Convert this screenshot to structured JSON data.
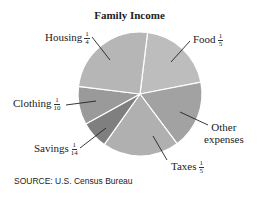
{
  "chart_data": {
    "type": "pie",
    "title": "Family Income",
    "start_angle_deg": 7,
    "direction": "clockwise",
    "slices": [
      {
        "label": "Food",
        "fraction_text": {
          "num": "1",
          "den": "5"
        },
        "value": 0.2,
        "color": "#bdbdbd"
      },
      {
        "label": "Other expenses",
        "fraction_text": null,
        "value": 0.1786,
        "color": "#a2a2a2"
      },
      {
        "label": "Taxes",
        "fraction_text": {
          "num": "1",
          "den": "5"
        },
        "value": 0.2,
        "color": "#b0b0b0"
      },
      {
        "label": "Savings",
        "fraction_text": {
          "num": "1",
          "den": "14"
        },
        "value": 0.0714,
        "color": "#7f7f7f"
      },
      {
        "label": "Clothing",
        "fraction_text": {
          "num": "1",
          "den": "10"
        },
        "value": 0.1,
        "color": "#9a9a9a"
      },
      {
        "label": "Housing",
        "fraction_text": {
          "num": "1",
          "den": "4"
        },
        "value": 0.25,
        "color": "#b6b6b6"
      }
    ],
    "source": "SOURCE: U.S. Census Bureau",
    "legend": "none (labels with leader lines)"
  },
  "labels": {
    "housing": {
      "name": "Housing",
      "num": "1",
      "den": "4"
    },
    "food": {
      "name": "Food",
      "num": "1",
      "den": "5"
    },
    "clothing": {
      "name": "Clothing",
      "num": "1",
      "den": "10"
    },
    "savings": {
      "name": "Savings",
      "num": "1",
      "den": "14"
    },
    "taxes": {
      "name": "Taxes",
      "num": "1",
      "den": "5"
    },
    "other": {
      "line1": "Other",
      "line2": "expenses"
    }
  },
  "title": "Family Income",
  "source": "SOURCE: U.S. Census Bureau"
}
